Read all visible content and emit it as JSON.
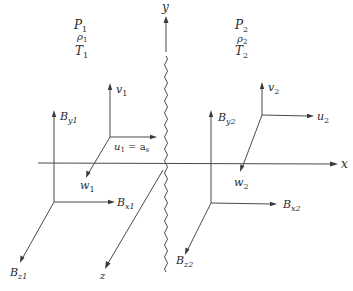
{
  "figure": {
    "colors": {
      "line": "#4a4a4a",
      "text": "#2a2a2a",
      "background": "#ffffff"
    }
  },
  "axes": {
    "x": {
      "label": "x"
    },
    "y": {
      "label": "y"
    },
    "z": {
      "label": "z"
    }
  },
  "region1": {
    "state": {
      "pressure": "P",
      "pressure_sub": "1",
      "density": "ρ",
      "density_sub": "1",
      "temperature": "T",
      "temperature_sub": "1"
    },
    "velocity": {
      "v": {
        "main": "v",
        "sub": "1"
      },
      "u": {
        "main": "u",
        "sub": "1",
        "suffix": " = a",
        "suffix_sub": "s"
      },
      "w": {
        "main": "w",
        "sub": "1"
      }
    },
    "field": {
      "By": {
        "main": "B",
        "sub": "y1"
      },
      "Bx": {
        "main": "B",
        "sub": "x1"
      },
      "Bz": {
        "main": "B",
        "sub": "z1"
      }
    }
  },
  "region2": {
    "state": {
      "pressure": "P",
      "pressure_sub": "2",
      "density": "ρ",
      "density_sub": "2",
      "temperature": "T",
      "temperature_sub": "2"
    },
    "velocity": {
      "v": {
        "main": "v",
        "sub": "2"
      },
      "u": {
        "main": "u",
        "sub": "2"
      },
      "w": {
        "main": "w",
        "sub": "2"
      }
    },
    "field": {
      "By": {
        "main": "B",
        "sub": "y2"
      },
      "Bx": {
        "main": "B",
        "sub": "x2"
      },
      "Bz": {
        "main": "B",
        "sub": "z2"
      }
    }
  }
}
